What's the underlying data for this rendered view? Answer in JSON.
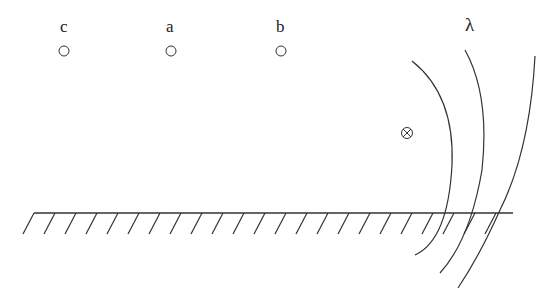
{
  "diagram": {
    "points": [
      {
        "label": "c",
        "x": 64,
        "y": 51
      },
      {
        "label": "a",
        "x": 171,
        "y": 51
      },
      {
        "label": "b",
        "x": 281,
        "y": 51
      }
    ],
    "source": {
      "symbol": "⊗",
      "x": 407,
      "y": 133
    },
    "wavelength_label": "λ",
    "ground": {
      "x1": 34,
      "x2": 513,
      "y": 213,
      "hatch_spacing": 21
    }
  }
}
